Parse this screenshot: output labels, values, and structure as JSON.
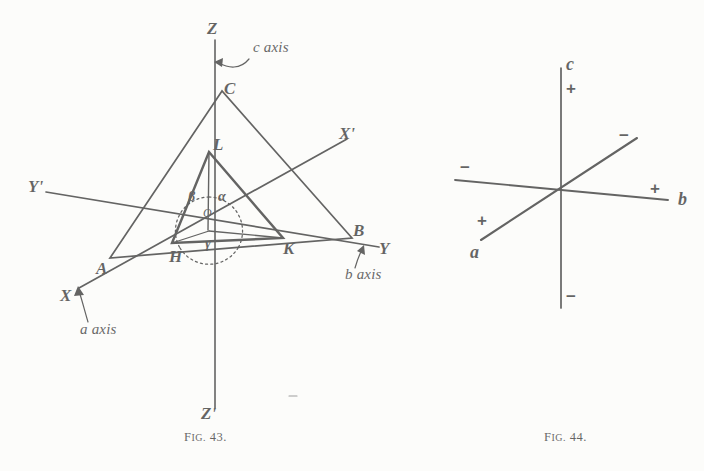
{
  "page": {
    "cut_off_header_text": "",
    "background_color": "#fdfdfc",
    "ink_color": "#141414"
  },
  "figure_43": {
    "caption": "Fig. 43.",
    "caption_prefix": "F",
    "caption_smallcaps": "IG.",
    "caption_number": " 43.",
    "axis_endpoint_labels": {
      "z_top": "Z",
      "z_bottom": "Z'",
      "x_lower_left": "X",
      "x_prime_upper_right": "X'",
      "y_right": "Y",
      "y_prime_left": "Y'"
    },
    "axis_annotations": {
      "c_axis": "c axis",
      "a_axis": "a axis",
      "b_axis": "b axis"
    },
    "outer_triangle_vertices": {
      "c_top": "C",
      "a_lower_left": "A",
      "b_lower_right": "B"
    },
    "inner_triangle_vertices": {
      "l_top": "L",
      "h_lower_left": "H",
      "k_lower_right": "K"
    },
    "center_point": "O",
    "interaxial_angles": {
      "alpha": "α",
      "beta": "β",
      "gamma": "γ"
    }
  },
  "figure_44": {
    "caption": "Fig. 44.",
    "caption_prefix": "F",
    "caption_smallcaps": "IG.",
    "caption_number": " 44.",
    "axis_labels": {
      "c": "c",
      "b": "b",
      "a": "a"
    },
    "signs": {
      "c_positive": "+",
      "c_negative": "−",
      "b_positive": "+",
      "b_negative": "−",
      "a_positive": "+",
      "a_negative": "−"
    }
  }
}
